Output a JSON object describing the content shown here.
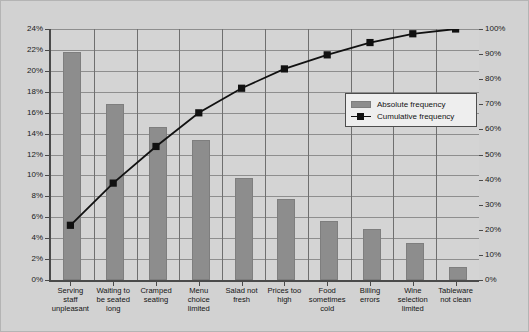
{
  "chart_data": {
    "type": "bar",
    "title": "",
    "subtitle": "",
    "xlabel": "",
    "ylabel": "",
    "grid": true,
    "legend_position": "inside-right",
    "categories": [
      "Serving staff unpleasant",
      "Waiting to be seated long",
      "Cramped seating",
      "Menu choice limited",
      "Salad not fresh",
      "Prices too high",
      "Food sometimes cold",
      "Billing errors",
      "Wine selection limited",
      "Tableware not clean"
    ],
    "category_lines": [
      [
        "Serving",
        "staff",
        "unpleasant"
      ],
      [
        "Waiting to",
        "be seated",
        "long"
      ],
      [
        "Cramped",
        "seating"
      ],
      [
        "Menu",
        "choice",
        "limited"
      ],
      [
        "Salad not",
        "fresh"
      ],
      [
        "Prices too",
        "high"
      ],
      [
        "Food",
        "sometimes",
        "cold"
      ],
      [
        "Billing",
        "errors"
      ],
      [
        "Wine",
        "selection",
        "limited"
      ],
      [
        "Tableware",
        "not clean"
      ]
    ],
    "series": [
      {
        "name": "Absolute frequency",
        "type": "bar",
        "axis": "left",
        "color": "#8d8d8d",
        "values": [
          21.8,
          16.8,
          14.6,
          13.4,
          9.8,
          7.7,
          5.6,
          4.9,
          3.5,
          1.2
        ]
      },
      {
        "name": "Cumulative frequency",
        "type": "line",
        "axis": "right",
        "color": "#111111",
        "values": [
          21.8,
          38.6,
          53.2,
          66.6,
          76.4,
          84.1,
          89.7,
          94.6,
          98.1,
          100.0
        ]
      }
    ],
    "y_left": {
      "min": 0,
      "max": 24,
      "step": 2,
      "ticks": [
        "0%",
        "2%",
        "4%",
        "6%",
        "8%",
        "10%",
        "12%",
        "14%",
        "16%",
        "18%",
        "20%",
        "22%",
        "24%"
      ]
    },
    "y_right": {
      "min": 0,
      "max": 100,
      "step": 10,
      "ticks": [
        "0%",
        "10%",
        "20%",
        "30%",
        "40%",
        "50%",
        "60%",
        "70%",
        "80%",
        "90%",
        "100%"
      ]
    },
    "legend": [
      {
        "label": "Absolute frequency",
        "marker": "bar-swatch"
      },
      {
        "label": "Cumulative frequency",
        "marker": "line-square-marker"
      }
    ],
    "colors": {
      "bar": "#8d8d8d",
      "line": "#111111",
      "background": "#d2d2d2",
      "plot_background": "#d4d4d4",
      "gridline": "#8e8e8e",
      "axis": "#4a4a4a",
      "legend_background": "#eeeeee"
    }
  }
}
